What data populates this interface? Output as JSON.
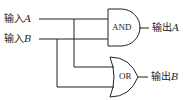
{
  "inputs": [
    {
      "prefix": "输入",
      "var": "A"
    },
    {
      "prefix": "输入",
      "var": "B"
    }
  ],
  "gates": [
    {
      "type": "AND",
      "label": "AND"
    },
    {
      "type": "OR",
      "label": "OR"
    }
  ],
  "outputs": [
    {
      "prefix": "输出",
      "var": "A"
    },
    {
      "prefix": "输出",
      "var": "B"
    }
  ],
  "colors": {
    "stroke": "#222222",
    "background": "#ffffff"
  }
}
